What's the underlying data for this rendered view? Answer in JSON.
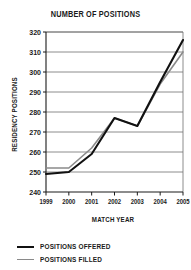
{
  "chart_data": {
    "type": "line",
    "title": "NUMBER OF POSITIONS",
    "xlabel": "MATCH YEAR",
    "ylabel": "RESIDENCY POSITIONS",
    "categories": [
      "1999",
      "2000",
      "2001",
      "2002",
      "2003",
      "2004",
      "2005"
    ],
    "x": [
      1999,
      2000,
      2001,
      2002,
      2003,
      2004,
      2005
    ],
    "series": [
      {
        "name": "POSITIONS OFFERED",
        "color": "#111111",
        "values": [
          249,
          250,
          259,
          277,
          273,
          295,
          316
        ]
      },
      {
        "name": "POSITIONS FILLED",
        "color": "#8a8a8a",
        "values": [
          252,
          252,
          262,
          277,
          273,
          294,
          310
        ]
      }
    ],
    "ylim": [
      240,
      320
    ],
    "ytick_step": 10,
    "yticks": [
      240,
      250,
      260,
      270,
      280,
      290,
      300,
      310,
      320
    ],
    "ytick_labels": [
      "240",
      "250",
      "260",
      "270",
      "280",
      "290",
      "300",
      "310",
      "320"
    ],
    "xtick_labels": [
      "1999",
      "2000",
      "2001",
      "2002",
      "2003",
      "2004",
      "2005"
    ],
    "grid": true,
    "grid_axis": "y",
    "legend_position": "bottom-left"
  },
  "legend": {
    "items": [
      {
        "label": "POSITIONS OFFERED",
        "swatch": "black-line-swatch"
      },
      {
        "label": "POSITIONS FILLED",
        "swatch": "gray-line-swatch"
      }
    ]
  }
}
